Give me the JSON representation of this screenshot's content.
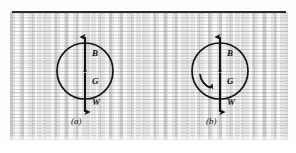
{
  "page": {
    "kind": "scanned-figure",
    "background_color": "#fdfdfd",
    "ink_color": "#1c1c1c",
    "rule_color": "#2b2b2b"
  },
  "figures": [
    {
      "caption": "(a)",
      "circle": {
        "cx": 85,
        "cy": 71,
        "r": 28
      },
      "vectors": [
        {
          "symbol": "B",
          "direction": "up",
          "label_x": 92,
          "label_y": 52
        },
        {
          "symbol": "G",
          "direction": "down",
          "label_x": 92,
          "label_y": 80
        },
        {
          "symbol": "W",
          "direction": "down",
          "label_x": 92,
          "label_y": 101
        }
      ],
      "rotation_arrow": false
    },
    {
      "caption": "(b)",
      "circle": {
        "cx": 220,
        "cy": 71,
        "r": 28
      },
      "vectors": [
        {
          "symbol": "B",
          "direction": "up",
          "label_x": 227,
          "label_y": 52
        },
        {
          "symbol": "G",
          "direction": "down",
          "label_x": 227,
          "label_y": 80
        },
        {
          "symbol": "W",
          "direction": "down",
          "label_x": 227,
          "label_y": 101
        }
      ],
      "rotation_arrow": true
    }
  ]
}
